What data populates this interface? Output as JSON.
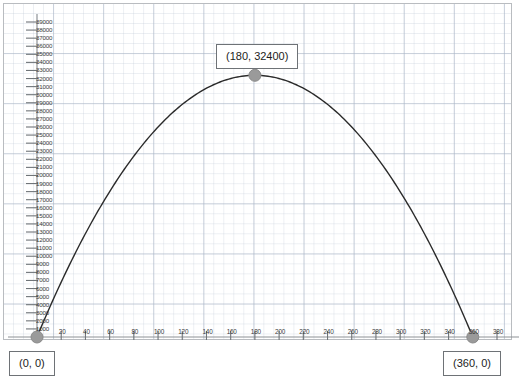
{
  "chart_data": {
    "type": "line",
    "title": "",
    "xlabel": "",
    "ylabel": "",
    "grid": true,
    "legend": "none",
    "xlim": [
      -20,
      400
    ],
    "ylim": [
      0,
      39500
    ],
    "equation": "y = -x^2 + 360x",
    "x_ticks": [
      20,
      40,
      60,
      80,
      100,
      120,
      140,
      160,
      180,
      200,
      220,
      240,
      260,
      280,
      300,
      320,
      340,
      360,
      380
    ],
    "y_ticks": [
      1000,
      2000,
      3000,
      4000,
      5000,
      6000,
      7000,
      8000,
      9000,
      10000,
      11000,
      12000,
      13000,
      14000,
      15000,
      16000,
      17000,
      18000,
      19000,
      20000,
      21000,
      22000,
      23000,
      24000,
      25000,
      26000,
      27000,
      28000,
      29000,
      30000,
      31000,
      32000,
      33000,
      34000,
      35000,
      36000,
      37000,
      38000,
      39000
    ],
    "series": [
      {
        "name": "parabola",
        "x": [
          0,
          20,
          40,
          60,
          80,
          100,
          120,
          140,
          160,
          180,
          200,
          220,
          240,
          260,
          280,
          300,
          320,
          340,
          360
        ],
        "values": [
          0,
          6800,
          12800,
          18000,
          22400,
          26000,
          28800,
          30800,
          32000,
          32400,
          32000,
          30800,
          28800,
          26000,
          22400,
          18000,
          12800,
          6800,
          0
        ]
      }
    ],
    "points": [
      {
        "name": "origin",
        "x": 0,
        "y": 0,
        "label": "(0, 0)"
      },
      {
        "name": "vertex",
        "x": 180,
        "y": 32400,
        "label": "(180, 32400)"
      },
      {
        "name": "root",
        "x": 360,
        "y": 0,
        "label": "(360, 0)"
      }
    ]
  },
  "annotations": {
    "vertex_label": "(180, 32400)",
    "origin_label": "(0, 0)",
    "root_label": "(360, 0)"
  },
  "colors": {
    "curve": "#2b2b2b",
    "marker": "#9a9a9a",
    "axis": "#8e9296",
    "grid": "#bec8d6",
    "frame": "#b9bcc0",
    "callout_border": "#6e7276",
    "background": "#ffffff"
  }
}
